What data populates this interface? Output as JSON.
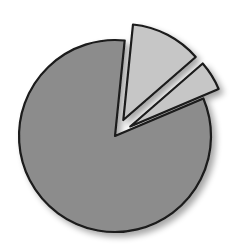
{
  "chart_data": {
    "type": "pie",
    "title": "",
    "legend": [],
    "labels": [
      "Slice A",
      "Slice B",
      "Slice C"
    ],
    "values": [
      83,
      12,
      5
    ],
    "exploded": [
      false,
      true,
      true
    ],
    "start_angle_deg": 67,
    "direction": "clockwise",
    "colors": [
      "#8c8c8c",
      "#c6c6c6",
      "#c6c6c6"
    ],
    "outline_color": "#1a1a1a",
    "data_labels": false,
    "grid": false
  },
  "geometry": {
    "cx": 115,
    "cy": 136,
    "r": 96,
    "explode_offset": 18
  }
}
